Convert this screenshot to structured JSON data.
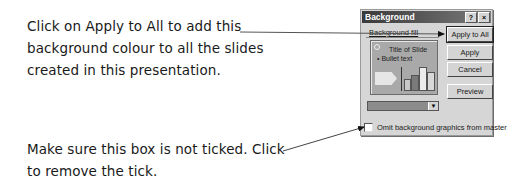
{
  "callouts": [
    {
      "lines": [
        "Click on Apply to All to add this",
        "background colour to all the slides",
        "created in this presentation."
      ]
    },
    {
      "lines": [
        "Make sure this box is not ticked. Click",
        "to remove the tick."
      ]
    }
  ],
  "dialog": {
    "title": "Background",
    "title_buttons": [
      "?",
      "×"
    ],
    "group_label": "Background fill",
    "preview": {
      "title_text": "Title of Slide",
      "bullet_text": "• Bullet text",
      "bars": [
        10,
        14,
        24,
        18
      ]
    },
    "dropdown": {
      "selected_value": ""
    },
    "checkbox": {
      "label": "Omit background graphics from master",
      "checked": false
    },
    "buttons": [
      "Apply to All",
      "Apply",
      "Cancel",
      "Preview"
    ]
  },
  "colors": {
    "dialog_bg": "#d6d6d6",
    "titlebar": "#3a3a3a",
    "preview_bg": "#a9a9a9"
  }
}
